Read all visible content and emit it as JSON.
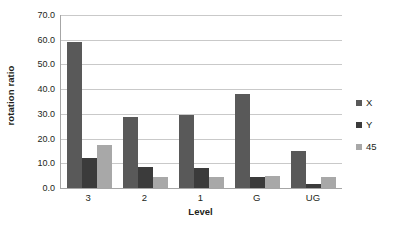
{
  "chart_data": {
    "type": "bar",
    "title": "",
    "subtitle": "",
    "xlabel": "Level",
    "ylabel": "rotation ratio",
    "categories": [
      "3",
      "2",
      "1",
      "G",
      "UG"
    ],
    "series": [
      {
        "name": "X",
        "color": "#595959",
        "values": [
          59.0,
          28.7,
          29.5,
          38.0,
          15.0
        ]
      },
      {
        "name": "Y",
        "color": "#3b3b3b",
        "values": [
          12.0,
          8.5,
          8.0,
          4.3,
          1.5
        ]
      },
      {
        "name": "45",
        "color": "#a8a8a8",
        "values": [
          17.3,
          4.5,
          4.3,
          5.0,
          4.5
        ]
      }
    ],
    "ylim": [
      0.0,
      70.0
    ],
    "ytick_values": [
      0.0,
      10.0,
      20.0,
      30.0,
      40.0,
      50.0,
      60.0,
      70.0
    ],
    "ytick_labels": [
      "0.0",
      "10.0",
      "20.0",
      "30.0",
      "40.0",
      "50.0",
      "60.0",
      "70.0"
    ],
    "grid": true,
    "grid_axis": "y",
    "legend_position": "right",
    "legend_entries": [
      "X",
      "Y",
      "45"
    ],
    "annotations": [],
    "background_color": "#ffffff",
    "gridline_color": "#c9c9c9",
    "axis_color": "#a6a6a6",
    "text_color": "#231f20"
  }
}
